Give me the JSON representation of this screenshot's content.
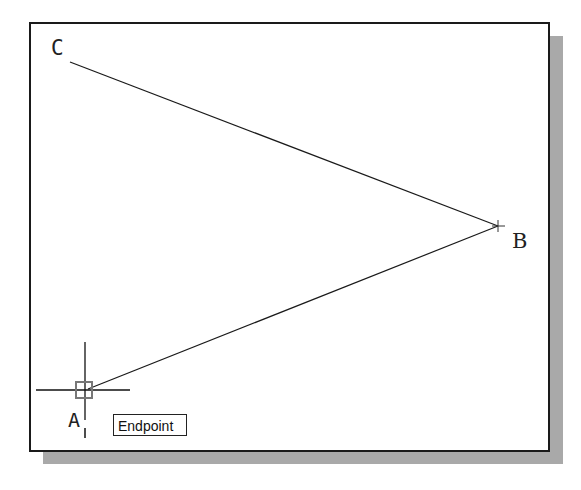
{
  "drawing": {
    "points": {
      "A": {
        "label": "A",
        "x": 88,
        "y": 389
      },
      "B": {
        "label": "B",
        "x": 498,
        "y": 226
      },
      "C": {
        "label": "C",
        "x": 70,
        "y": 62
      }
    },
    "lines": [
      {
        "from": "C",
        "to": "B"
      },
      {
        "from": "B",
        "to": "A"
      }
    ],
    "line_color": "#1a1a1a"
  },
  "cursor": {
    "x": 85,
    "y": 390,
    "osnap_marker": "endpoint-square"
  },
  "tooltip": {
    "text": "Endpoint"
  },
  "colors": {
    "background": "#ffffff",
    "frame": "#1a1a1a",
    "shadow": "#a9a9a9",
    "osnap_marker": "#777777"
  }
}
